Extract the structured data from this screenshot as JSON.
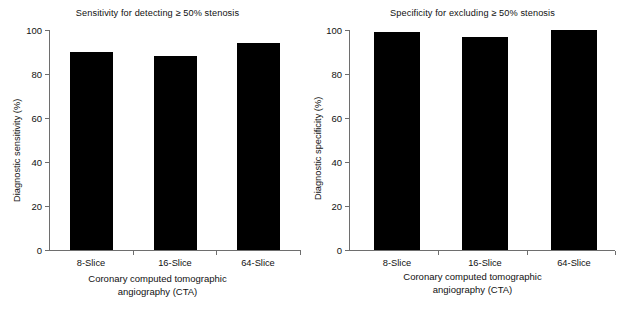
{
  "chart_data": [
    {
      "type": "bar",
      "title": "Sensitivity for detecting ≥ 50% stenosis",
      "categories": [
        "8-Slice",
        "16-Slice",
        "64-Slice"
      ],
      "values": [
        90,
        88,
        94
      ],
      "xlabel": "Coronary computed tomographic angiography (CTA)",
      "xlabel_line1": "Coronary computed tomographic",
      "xlabel_line2": "angiography (CTA)",
      "ylabel": "Diagnostic sensitivity (%)",
      "ylim": [
        0,
        100
      ],
      "yticks": [
        0,
        20,
        40,
        60,
        80,
        100
      ],
      "ytick_labels": [
        "0",
        "20",
        "40",
        "60",
        "80",
        "100"
      ],
      "grid": false,
      "legend": null,
      "bar_color": "#000000",
      "axis_color": "#6e6e6e"
    },
    {
      "type": "bar",
      "title": "Specificity for excluding ≥ 50% stenosis",
      "categories": [
        "8-Slice",
        "16-Slice",
        "64-Slice"
      ],
      "values": [
        99,
        97,
        100
      ],
      "xlabel": "Coronary computed tomographic angiography (CTA)",
      "xlabel_line1": "Coronary computed tomographic",
      "xlabel_line2": "angiography (CTA)",
      "ylabel": "Diagnostic specificity (%)",
      "ylim": [
        0,
        100
      ],
      "yticks": [
        0,
        20,
        40,
        60,
        80,
        100
      ],
      "ytick_labels": [
        "0",
        "20",
        "40",
        "60",
        "80",
        "100"
      ],
      "grid": false,
      "legend": null,
      "bar_color": "#000000",
      "axis_color": "#6e6e6e"
    }
  ],
  "panels": [
    {
      "title": "Sensitivity for detecting ≥ 50% stenosis",
      "ylabel": "Diagnostic sensitivity (%)",
      "xlabel_line1": "Coronary computed tomographic",
      "xlabel_line2": "angiography (CTA)",
      "yticks": [
        "100",
        "80",
        "60",
        "40",
        "20",
        "0"
      ],
      "bars": [
        {
          "label": "8-Slice",
          "value": 90
        },
        {
          "label": "16-Slice",
          "value": 88
        },
        {
          "label": "64-Slice",
          "value": 94
        }
      ]
    },
    {
      "title": "Specificity for excluding ≥ 50% stenosis",
      "ylabel": "Diagnostic specificity (%)",
      "xlabel_line1": "Coronary computed tomographic",
      "xlabel_line2": "angiography (CTA)",
      "yticks": [
        "100",
        "80",
        "60",
        "40",
        "20",
        "0"
      ],
      "bars": [
        {
          "label": "8-Slice",
          "value": 99
        },
        {
          "label": "16-Slice",
          "value": 97
        },
        {
          "label": "64-Slice",
          "value": 100
        }
      ]
    }
  ]
}
